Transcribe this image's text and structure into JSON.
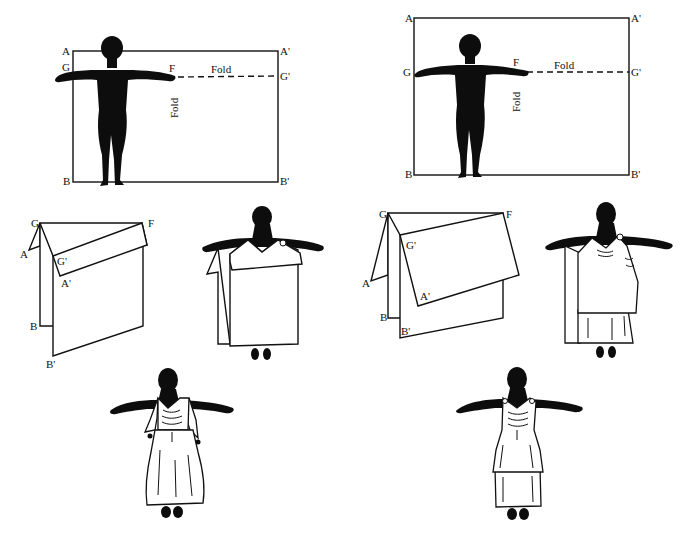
{
  "figure": {
    "colors": {
      "ink": "#111111",
      "background": "#ffffff"
    }
  },
  "panels": {
    "left_top": {
      "labels": {
        "a": "A",
        "a_prime": "A'",
        "g": "G",
        "g_prime": "G'",
        "f": "F",
        "b": "B",
        "b_prime": "B'"
      },
      "fold_horizontal": "Fold",
      "fold_vertical": "Fold"
    },
    "right_top": {
      "labels": {
        "a": "A",
        "a_prime": "A'",
        "g": "G",
        "g_prime": "G'",
        "f": "F",
        "b": "B",
        "b_prime": "B'"
      },
      "fold_horizontal": "Fold",
      "fold_vertical": "Fold"
    },
    "left_mid_fold": {
      "labels": {
        "g": "G",
        "f": "F",
        "a": "A",
        "g_prime": "G'",
        "a_prime": "A'",
        "b": "B",
        "b_prime": "B'"
      }
    },
    "right_mid_fold": {
      "labels": {
        "g": "G",
        "f": "F",
        "g_prime": "G'",
        "a": "A",
        "a_prime": "A'",
        "b": "B",
        "b_prime": "B'"
      }
    }
  }
}
